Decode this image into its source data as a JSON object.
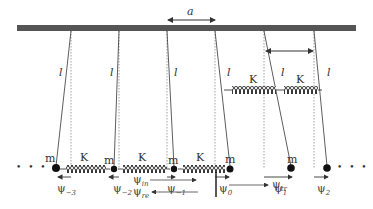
{
  "diagram": {
    "spacing_label": "a",
    "length_label": "l",
    "spring_label": "K",
    "mass_label": "m",
    "ellipsis": "• • •",
    "displacements": [
      {
        "sym": "ψ",
        "sub": "−3"
      },
      {
        "sym": "ψ",
        "sub": "−2"
      },
      {
        "sym": "ψ",
        "sub": "−1"
      },
      {
        "sym": "ψ",
        "sub": "0"
      },
      {
        "sym": "ψ",
        "sub": "1"
      },
      {
        "sym": "ψ",
        "sub": "2"
      }
    ],
    "waves": {
      "incident": {
        "sym": "ψ",
        "sub": "in"
      },
      "reflected": {
        "sym": "ψ",
        "sub": "re"
      },
      "transmitted": {
        "sym": "ψ",
        "sub": "tr"
      }
    },
    "colors": {
      "bar": "#555555",
      "line": "#444444",
      "mass": "#111111"
    }
  }
}
